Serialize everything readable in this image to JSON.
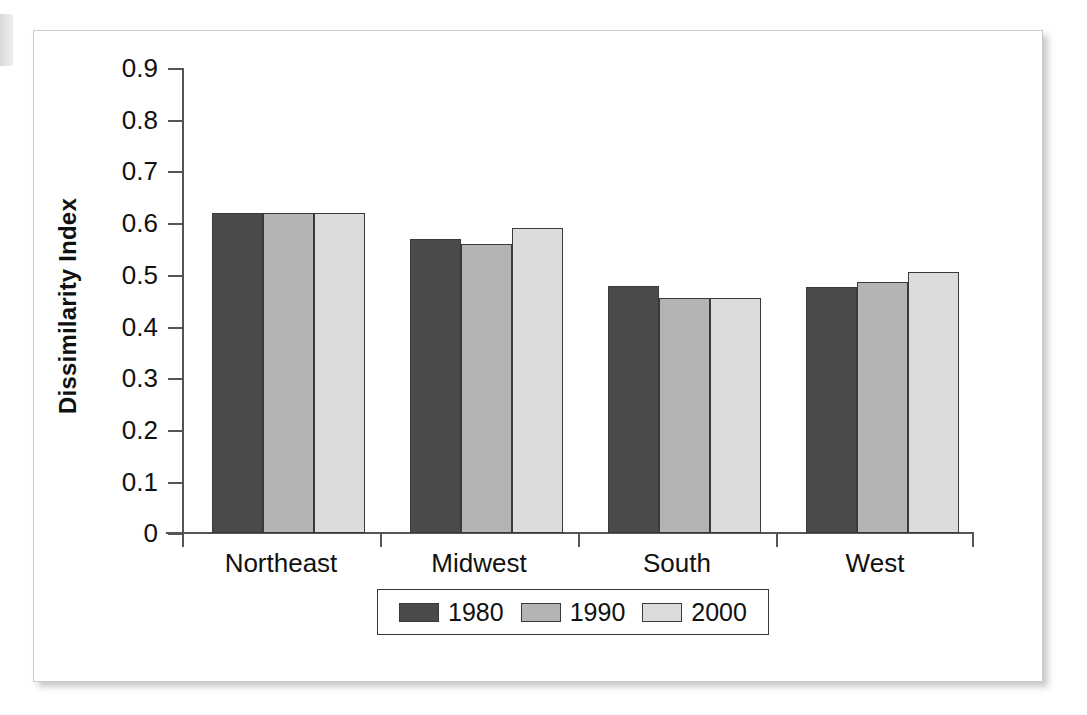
{
  "chart_data": {
    "type": "bar",
    "title": "",
    "subtitle": "",
    "xlabel": "",
    "ylabel": "Dissimilarity Index",
    "categories": [
      "Northeast",
      "Midwest",
      "South",
      "West"
    ],
    "series": [
      {
        "name": "1980",
        "color": "#4a4a4a",
        "values": [
          0.62,
          0.57,
          0.478,
          0.477
        ]
      },
      {
        "name": "1990",
        "color": "#b4b4b4",
        "values": [
          0.62,
          0.56,
          0.456,
          0.486
        ]
      },
      {
        "name": "2000",
        "color": "#dcdcdc",
        "values": [
          0.62,
          0.59,
          0.456,
          0.505
        ]
      }
    ],
    "ylim": [
      0,
      0.9
    ],
    "ytick_labels": [
      "0.9",
      "0.8",
      "0.7",
      "0.6",
      "0.5",
      "0.4",
      "0.3",
      "0.2",
      "0.1",
      "0"
    ],
    "ytick_values": [
      0.9,
      0.8,
      0.7,
      0.6,
      0.5,
      0.4,
      0.3,
      0.2,
      0.1,
      0
    ],
    "grid": false,
    "legend_position": "bottom",
    "legend_entries": [
      "1980",
      "1990",
      "2000"
    ]
  },
  "axis": {
    "y_title": "Dissimilarity Index",
    "ticks": [
      {
        "label": "0.9"
      },
      {
        "label": "0.8"
      },
      {
        "label": "0.7"
      },
      {
        "label": "0.6"
      },
      {
        "label": "0.5"
      },
      {
        "label": "0.4"
      },
      {
        "label": "0.3"
      },
      {
        "label": "0.2"
      },
      {
        "label": "0.1"
      },
      {
        "label": "0"
      }
    ]
  },
  "categories": [
    {
      "label": "Northeast"
    },
    {
      "label": "Midwest"
    },
    {
      "label": "South"
    },
    {
      "label": "West"
    }
  ],
  "legend": {
    "items": [
      {
        "label": "1980",
        "color": "#4a4a4a"
      },
      {
        "label": "1990",
        "color": "#b4b4b4"
      },
      {
        "label": "2000",
        "color": "#dcdcdc"
      }
    ]
  }
}
